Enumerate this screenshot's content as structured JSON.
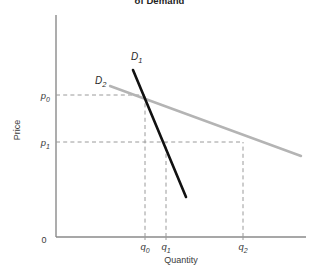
{
  "title": "of Demand",
  "axes": {
    "x_label": "Quantity",
    "y_label": "Price",
    "origin_label": "0"
  },
  "y_ticks": [
    {
      "id": "p0",
      "base": "p",
      "sub": "0",
      "y": 95
    },
    {
      "id": "p1",
      "base": "p",
      "sub": "1",
      "y": 142
    }
  ],
  "x_ticks": [
    {
      "id": "q0",
      "base": "q",
      "sub": "0",
      "x": 145
    },
    {
      "id": "q1",
      "base": "q",
      "sub": "1",
      "x": 166
    },
    {
      "id": "q2",
      "base": "q",
      "sub": "2",
      "x": 243
    }
  ],
  "curves": [
    {
      "id": "D1",
      "base": "D",
      "sub": "1",
      "color": "#111111",
      "width": 2.6,
      "label_x": 131,
      "label_y": 60,
      "x1": 133,
      "y1": 70,
      "x2": 186,
      "y2": 197
    },
    {
      "id": "D2",
      "base": "D",
      "sub": "2",
      "color": "#b4b4b4",
      "width": 2.4,
      "label_x": 95,
      "label_y": 84,
      "x1": 110,
      "y1": 86,
      "x2": 301,
      "y2": 156
    }
  ],
  "colors": {
    "axis": "#8a8a8a",
    "guide": "#9a9a9a",
    "d1": "#111111",
    "d2": "#b4b4b4",
    "text": "#3a3a3a",
    "background": "#ffffff"
  },
  "chart_data": {
    "type": "line",
    "title": "of Demand",
    "xlabel": "Quantity",
    "ylabel": "Price",
    "xlim": [
      0,
      100
    ],
    "ylim": [
      0,
      100
    ],
    "grid": false,
    "legend": "inline-curve-labels",
    "annotations": [
      "D1 is the steep (inelastic) demand curve",
      "D2 is the flat (elastic) demand curve",
      "Both curves pass through the common point (q0, p0)",
      "A fall in price from p0 to p1 raises quantity to q1 along D1 and to q2 along D2"
    ],
    "series": [
      {
        "name": "D1",
        "description": "Steep / inelastic demand curve",
        "color": "#111111",
        "points": [
          {
            "x": 32,
            "y": 75
          },
          {
            "x": 53,
            "y": 24
          }
        ]
      },
      {
        "name": "D2",
        "description": "Flat / elastic demand curve",
        "color": "#b4b4b4",
        "points": [
          {
            "x": 22,
            "y": 68
          },
          {
            "x": 98,
            "y": 37
          }
        ]
      }
    ],
    "reference_points": [
      {
        "label": "p0",
        "axis": "y",
        "value": 64,
        "description": "initial price"
      },
      {
        "label": "p1",
        "axis": "y",
        "value": 43,
        "description": "lower price"
      },
      {
        "label": "q0",
        "axis": "x",
        "value": 36,
        "description": "quantity at p0 on both curves"
      },
      {
        "label": "q1",
        "axis": "x",
        "value": 44,
        "description": "quantity at p1 on D1"
      },
      {
        "label": "q2",
        "axis": "x",
        "value": 75,
        "description": "quantity at p1 on D2"
      }
    ]
  }
}
